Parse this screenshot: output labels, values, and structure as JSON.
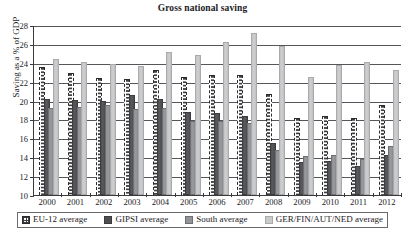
{
  "chart_data": {
    "type": "bar",
    "title": "Gross national saving",
    "xlabel": "",
    "ylabel": "Saving as a % of GDP",
    "ylim": [
      10,
      28
    ],
    "ytick_step": 2,
    "yticks": [
      28,
      26,
      24,
      22,
      20,
      18,
      16,
      14,
      12,
      10
    ],
    "grid": true,
    "legend_position": "bottom",
    "categories": [
      "2000",
      "2001",
      "2002",
      "2003",
      "2004",
      "2005",
      "2006",
      "2007",
      "2008",
      "2009",
      "2010",
      "2011",
      "2012"
    ],
    "series": [
      {
        "name": "EU-12 average",
        "color": "#fdfdfd",
        "pattern": "dotted-outline",
        "values": [
          23.4,
          22.8,
          22.3,
          22.2,
          23.1,
          22.4,
          22.6,
          22.6,
          20.6,
          18.0,
          18.3,
          18.1,
          19.4
        ]
      },
      {
        "name": "GIPSI average",
        "color": "#4f4f52",
        "pattern": "solid-dark",
        "values": [
          20.0,
          19.9,
          19.7,
          20.4,
          20.0,
          18.6,
          18.5,
          18.2,
          15.3,
          13.3,
          13.4,
          12.9,
          14.0
        ]
      },
      {
        "name": "South average",
        "color": "#939497",
        "pattern": "solid-medium",
        "values": [
          19.0,
          19.1,
          19.3,
          18.9,
          19.0,
          17.6,
          17.6,
          17.4,
          14.6,
          13.9,
          14.0,
          13.6,
          15.0
        ]
      },
      {
        "name": "GER/FIN/AUT/NED average",
        "color": "#c9cacc",
        "pattern": "solid-light",
        "values": [
          24.2,
          23.9,
          23.7,
          23.4,
          24.9,
          24.6,
          26.0,
          26.9,
          25.6,
          22.3,
          23.6,
          23.9,
          23.0
        ]
      }
    ]
  }
}
